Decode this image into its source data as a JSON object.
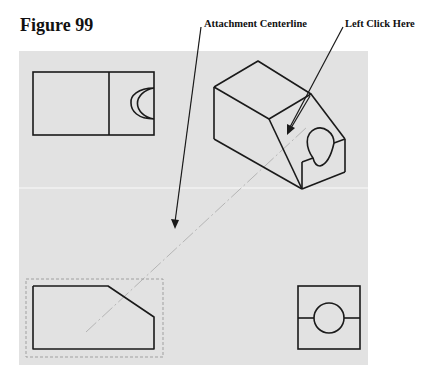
{
  "figure": {
    "title": "Figure 99"
  },
  "callouts": [
    {
      "label": "Attachment Centerline",
      "target": "centerline"
    },
    {
      "label": "Left Click Here",
      "target": "slanted-face"
    }
  ],
  "drawing": {
    "background_color": "#e2e2e2",
    "line_color": "#1a1a1a",
    "views": [
      {
        "name": "top-view",
        "position": "top-left"
      },
      {
        "name": "isometric-view",
        "position": "top-right"
      },
      {
        "name": "front-view",
        "position": "bottom-left",
        "selected": true
      },
      {
        "name": "side-view",
        "position": "bottom-right"
      }
    ]
  }
}
